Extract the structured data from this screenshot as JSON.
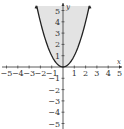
{
  "problem_label": "",
  "chart_data": {
    "type": "area",
    "title": "",
    "equation": "y = x^2",
    "inequality": "y ≥ x²",
    "shaded_region": "above parabola",
    "boundary_style": "solid",
    "xlabel": "x",
    "ylabel": "y",
    "xlim": [
      -5,
      5
    ],
    "ylim": [
      -5,
      5
    ],
    "x_ticks": [
      -5,
      -4,
      -3,
      -2,
      -1,
      1,
      2,
      3,
      4,
      5
    ],
    "y_ticks": [
      -5,
      -4,
      -3,
      -2,
      -1,
      1,
      2,
      3,
      4,
      5
    ],
    "x_tick_labels": [
      "−5",
      "−4",
      "−3",
      "−2",
      "−1",
      "1",
      "2",
      "3",
      "4",
      "5"
    ],
    "y_tick_labels": [
      "5",
      "4",
      "3",
      "2",
      "1",
      "−1",
      "−2",
      "−3",
      "−4",
      "−5"
    ],
    "vertex": [
      0,
      0
    ],
    "sample_points": [
      {
        "x": -2.3,
        "y": 5.3
      },
      {
        "x": -2,
        "y": 4
      },
      {
        "x": -1,
        "y": 1
      },
      {
        "x": 0,
        "y": 0
      },
      {
        "x": 1,
        "y": 1
      },
      {
        "x": 2,
        "y": 4
      },
      {
        "x": 2.3,
        "y": 5.3
      }
    ],
    "grid": false,
    "colors": {
      "shade": "#e3e3e3",
      "curve": "#222222",
      "axis": "#333333"
    }
  }
}
